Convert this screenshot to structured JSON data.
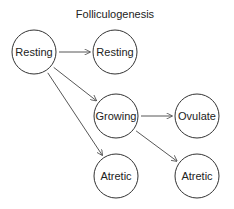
{
  "title": "Folliculogenesis",
  "nodes": [
    {
      "id": "resting_a",
      "label": "Resting",
      "cx": 34,
      "cy": 52
    },
    {
      "id": "resting_b",
      "label": "Resting",
      "cx": 115,
      "cy": 52
    },
    {
      "id": "growing",
      "label": "Growing",
      "cx": 116,
      "cy": 116
    },
    {
      "id": "ovulate",
      "label": "Ovulate",
      "cx": 197,
      "cy": 116
    },
    {
      "id": "atretic_a",
      "label": "Atretic",
      "cx": 116,
      "cy": 176
    },
    {
      "id": "atretic_b",
      "label": "Atretic",
      "cx": 197,
      "cy": 176
    }
  ],
  "edges": [
    {
      "from": "resting_a",
      "to": "resting_b"
    },
    {
      "from": "resting_a",
      "to": "growing"
    },
    {
      "from": "resting_a",
      "to": "atretic_a"
    },
    {
      "from": "growing",
      "to": "ovulate"
    },
    {
      "from": "growing",
      "to": "atretic_b"
    }
  ],
  "style": {
    "node_radius": 22,
    "stroke_color": "#333333"
  }
}
